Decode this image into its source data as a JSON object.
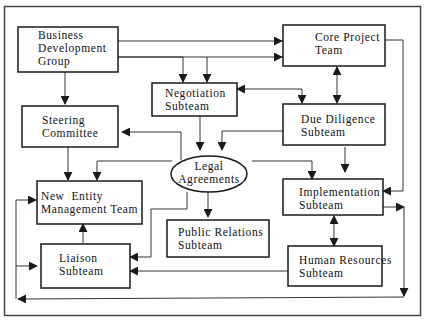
{
  "diagram": {
    "type": "organizational-flowchart",
    "colors": {
      "line": "#1a1a1a",
      "box_fill": "#ffffff",
      "background": "#ffffff"
    },
    "nodes": [
      {
        "id": "bdg",
        "shape": "rect",
        "lines": [
          "Business",
          "Development",
          "Group"
        ]
      },
      {
        "id": "core",
        "shape": "rect",
        "lines": [
          "Core Project",
          "Team"
        ]
      },
      {
        "id": "neg",
        "shape": "rect",
        "lines": [
          "Negotiation",
          "Subteam"
        ]
      },
      {
        "id": "steer",
        "shape": "rect",
        "lines": [
          "Steering",
          "Committee"
        ]
      },
      {
        "id": "due",
        "shape": "rect",
        "lines": [
          "Due Diligence",
          "Subteam"
        ]
      },
      {
        "id": "legal",
        "shape": "ellipse",
        "lines": [
          "Legal",
          "Agreements"
        ]
      },
      {
        "id": "nemt",
        "shape": "rect",
        "lines": [
          "New  Entity",
          "Management Team"
        ]
      },
      {
        "id": "impl",
        "shape": "rect",
        "lines": [
          "Implementation",
          "Subteam"
        ]
      },
      {
        "id": "pr",
        "shape": "rect",
        "lines": [
          "Public Relations",
          "Subteam"
        ]
      },
      {
        "id": "liaison",
        "shape": "rect",
        "lines": [
          "Liaison",
          "Subteam"
        ]
      },
      {
        "id": "hr",
        "shape": "rect",
        "lines": [
          "Human Resources",
          "Subteam"
        ]
      }
    ],
    "edges": [
      {
        "from": "bdg",
        "to": "core"
      },
      {
        "from": "bdg",
        "to": "core"
      },
      {
        "from": "bdg",
        "to": "neg"
      },
      {
        "from": "bdg",
        "to": "steer"
      },
      {
        "from": "core",
        "to": "neg"
      },
      {
        "from": "core",
        "to": "due",
        "bidirectional": true
      },
      {
        "from": "core",
        "to": "impl"
      },
      {
        "from": "neg",
        "to": "legal"
      },
      {
        "from": "neg",
        "to": "due",
        "bidirectional": true
      },
      {
        "from": "due",
        "to": "legal"
      },
      {
        "from": "due",
        "to": "impl"
      },
      {
        "from": "legal",
        "to": "steer"
      },
      {
        "from": "legal",
        "to": "nemt"
      },
      {
        "from": "legal",
        "to": "impl"
      },
      {
        "from": "legal",
        "to": "pr"
      },
      {
        "from": "legal",
        "to": "liaison"
      },
      {
        "from": "steer",
        "to": "nemt"
      },
      {
        "from": "liaison",
        "to": "nemt"
      },
      {
        "from": "impl",
        "to": "hr",
        "bidirectional": true
      },
      {
        "from": "impl",
        "to": "bottom-loop"
      },
      {
        "from": "hr",
        "to": "liaison"
      },
      {
        "from": "bottom-loop",
        "to": "nemt"
      },
      {
        "from": "bottom-loop",
        "to": "liaison"
      }
    ]
  }
}
